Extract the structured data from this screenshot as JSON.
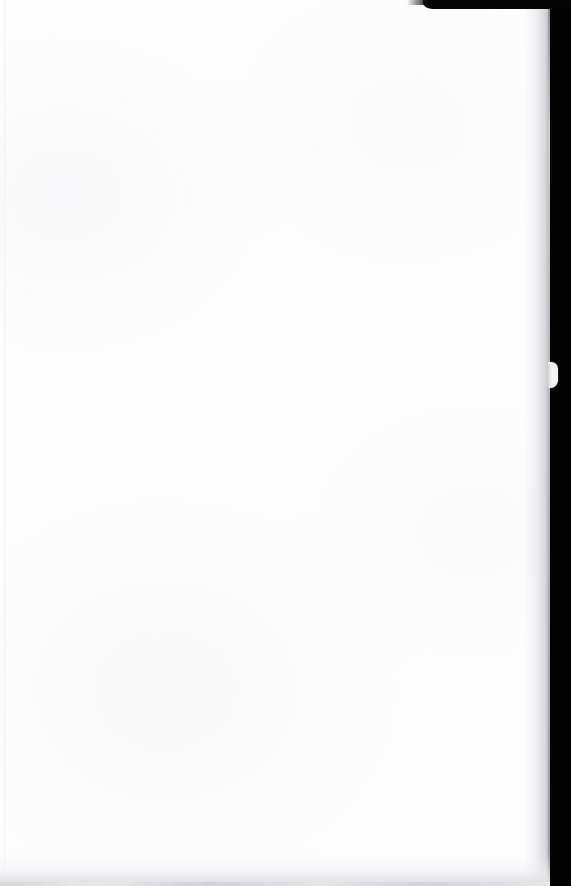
{
  "document": {
    "kind": "scanned-page",
    "page_state": "blank",
    "body_text": "",
    "notes": "No printed text, headings, figures, page number or marginalia are visible on this page."
  },
  "scan": {
    "paper_color": "#fdfdfd",
    "backdrop_color": "#030303",
    "page_edge_color": "#b4b4ba",
    "bottom_shadow_color": "#cdcdd4",
    "notch_color": "#f4f4f5"
  },
  "regions": {
    "top_black_band_label": "scanner-backdrop-top-right",
    "right_black_band_label": "scanner-backdrop-right",
    "notch_label": "page-edge-notch",
    "bottom_shadow_label": "page-bottom-shadow",
    "left_crease_label": "page-left-crease",
    "content_area_label": "page-content-area"
  }
}
